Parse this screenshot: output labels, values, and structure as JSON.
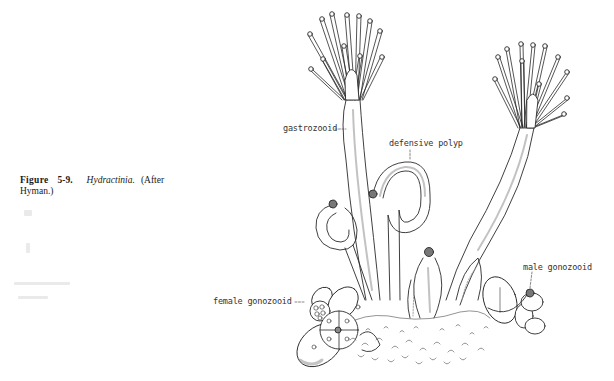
{
  "caption": {
    "figure_label": "Figure",
    "figure_number": "5-9.",
    "genus": "Hydractinia.",
    "attribution": "(After Hyman.)"
  },
  "labels": {
    "gastrozooid": "gastrozooid",
    "defensive_polyp": "defensive polyp",
    "female_gonozooid": "female gonozooid",
    "male_gonozooid": "male gonozooid"
  },
  "colors": {
    "ink": "#2a2a2a",
    "stipple": "#8a8a8a",
    "background": "#ffffff"
  }
}
